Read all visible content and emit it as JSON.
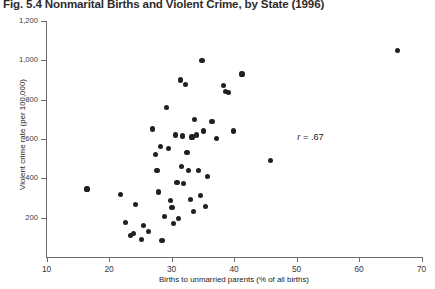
{
  "title": "Fig. 5.4 Nonmarital Births and Violent Crime, by State (1996)",
  "annotation": {
    "symbol": "r",
    "rest": " = .67",
    "full": "r = .67",
    "x": 53.0,
    "y": 605
  },
  "axes": {
    "x_label": "Births to unmarried parents (% of all births)",
    "y_label": "Violent crime rate (per 100,000)",
    "x_ticks": [
      10,
      20,
      30,
      40,
      50,
      60,
      70
    ],
    "x_tick_labels": [
      "10",
      "20",
      "30",
      "40",
      "50",
      "60",
      "70"
    ],
    "y_ticks": [
      200,
      400,
      600,
      800,
      1000,
      1200
    ],
    "y_tick_labels": [
      "200",
      "400",
      "600",
      "800",
      "1,000",
      "1,200"
    ],
    "xlim": [
      10,
      70
    ],
    "ylim": [
      0,
      1200
    ]
  },
  "style": {
    "point_color": "#231f20",
    "axis_color": "#6e6b6c",
    "text_color": "#262223",
    "title_color": "#2f2b2c",
    "background": "#ffffff"
  },
  "chart_data": {
    "type": "scatter",
    "title": "Fig. 5.4 Nonmarital Births and Violent Crime, by State (1996)",
    "xlabel": "Births to unmarried parents (% of all births)",
    "ylabel": "Violent crime rate (per 100,000)",
    "xlim": [
      10,
      70
    ],
    "ylim": [
      0,
      1200
    ],
    "grid": false,
    "legend": null,
    "annotations": [
      {
        "text": "r = .67",
        "x": 53.0,
        "y": 605
      }
    ],
    "correlation": 0.67,
    "n_points": 51,
    "points": [
      {
        "x": 16.4,
        "y": 345
      },
      {
        "x": 21.8,
        "y": 315
      },
      {
        "x": 22.6,
        "y": 175
      },
      {
        "x": 23.4,
        "y": 110
      },
      {
        "x": 23.9,
        "y": 120
      },
      {
        "x": 24.2,
        "y": 265
      },
      {
        "x": 25.1,
        "y": 90
      },
      {
        "x": 25.4,
        "y": 160
      },
      {
        "x": 26.3,
        "y": 130
      },
      {
        "x": 26.9,
        "y": 650
      },
      {
        "x": 27.3,
        "y": 520
      },
      {
        "x": 27.6,
        "y": 440
      },
      {
        "x": 27.9,
        "y": 330
      },
      {
        "x": 28.1,
        "y": 560
      },
      {
        "x": 28.4,
        "y": 85
      },
      {
        "x": 28.8,
        "y": 205
      },
      {
        "x": 29.1,
        "y": 760
      },
      {
        "x": 29.4,
        "y": 550
      },
      {
        "x": 29.7,
        "y": 285
      },
      {
        "x": 30.0,
        "y": 250
      },
      {
        "x": 30.3,
        "y": 170
      },
      {
        "x": 30.6,
        "y": 620
      },
      {
        "x": 30.8,
        "y": 380
      },
      {
        "x": 31.0,
        "y": 195
      },
      {
        "x": 31.3,
        "y": 900
      },
      {
        "x": 31.5,
        "y": 460
      },
      {
        "x": 31.7,
        "y": 615
      },
      {
        "x": 31.9,
        "y": 375
      },
      {
        "x": 32.2,
        "y": 875
      },
      {
        "x": 32.4,
        "y": 530
      },
      {
        "x": 32.7,
        "y": 440
      },
      {
        "x": 32.9,
        "y": 290
      },
      {
        "x": 33.2,
        "y": 610
      },
      {
        "x": 33.4,
        "y": 230
      },
      {
        "x": 33.6,
        "y": 700
      },
      {
        "x": 33.9,
        "y": 620
      },
      {
        "x": 34.2,
        "y": 440
      },
      {
        "x": 34.5,
        "y": 310
      },
      {
        "x": 34.8,
        "y": 1000
      },
      {
        "x": 35.1,
        "y": 640
      },
      {
        "x": 35.4,
        "y": 255
      },
      {
        "x": 35.7,
        "y": 410
      },
      {
        "x": 36.4,
        "y": 690
      },
      {
        "x": 37.1,
        "y": 600
      },
      {
        "x": 38.2,
        "y": 870
      },
      {
        "x": 38.6,
        "y": 840
      },
      {
        "x": 39.1,
        "y": 835
      },
      {
        "x": 39.8,
        "y": 640
      },
      {
        "x": 41.2,
        "y": 930
      },
      {
        "x": 45.8,
        "y": 490
      },
      {
        "x": 66.1,
        "y": 1050
      }
    ]
  }
}
